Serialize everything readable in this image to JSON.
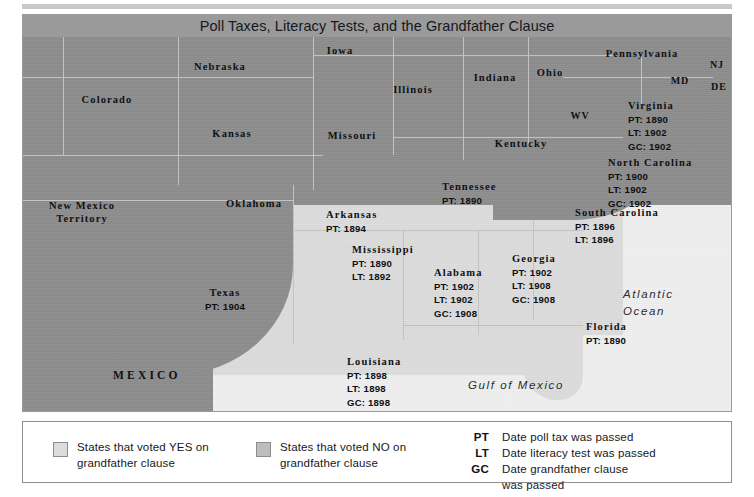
{
  "map": {
    "title": "Poll Taxes, Literacy Tests, and the Grandfather Clause",
    "colors": {
      "voted_no_fill": "#8d8d8d",
      "voted_yes_fill": "#dcdcdc",
      "ocean": "#efefef",
      "border": "#c3c3c3",
      "title_band": "#9a9a9a"
    },
    "water_labels": [
      {
        "name": "atlantic-ocean",
        "line1": "Atlantic",
        "line2": "Ocean"
      },
      {
        "name": "gulf-of-mexico",
        "line1": "Gulf of Mexico",
        "line2": ""
      }
    ],
    "country_label": "MEXICO",
    "plain_states": [
      {
        "name": "Nebraska",
        "label": "Nebraska"
      },
      {
        "name": "Iowa",
        "label": "Iowa"
      },
      {
        "name": "Colorado",
        "label": "Colorado"
      },
      {
        "name": "Kansas",
        "label": "Kansas"
      },
      {
        "name": "Missouri",
        "label": "Missouri"
      },
      {
        "name": "Illinois",
        "label": "Illinois"
      },
      {
        "name": "Indiana",
        "label": "Indiana"
      },
      {
        "name": "Ohio",
        "label": "Ohio"
      },
      {
        "name": "Pennsylvania",
        "label": "Pennsylvania"
      },
      {
        "name": "Kentucky",
        "label": "Kentucky"
      },
      {
        "name": "Oklahoma",
        "label": "Oklahoma"
      },
      {
        "name": "New Mexico Territory",
        "line1": "New Mexico",
        "line2": "Territory"
      },
      {
        "name": "West Virginia",
        "label": "WV"
      },
      {
        "name": "Maryland",
        "label": "MD"
      },
      {
        "name": "New Jersey",
        "label": "NJ"
      },
      {
        "name": "Delaware",
        "label": "DE"
      }
    ],
    "dated_states": [
      {
        "name": "Virginia",
        "label": "Virginia",
        "pt": "PT: 1890",
        "lt": "LT: 1902",
        "gc": "GC: 1902"
      },
      {
        "name": "North Carolina",
        "label": "North Carolina",
        "pt": "PT: 1900",
        "lt": "LT: 1902",
        "gc": "GC: 1902"
      },
      {
        "name": "South Carolina",
        "label": "South Carolina",
        "pt": "PT: 1896",
        "lt": "LT: 1896",
        "gc": ""
      },
      {
        "name": "Georgia",
        "label": "Georgia",
        "pt": "PT: 1902",
        "lt": "LT: 1908",
        "gc": "GC: 1908"
      },
      {
        "name": "Florida",
        "label": "Florida",
        "pt": "PT: 1890",
        "lt": "",
        "gc": ""
      },
      {
        "name": "Alabama",
        "label": "Alabama",
        "pt": "PT: 1902",
        "lt": "LT: 1902",
        "gc": "GC: 1908"
      },
      {
        "name": "Mississippi",
        "label": "Mississippi",
        "pt": "PT: 1890",
        "lt": "LT: 1892",
        "gc": ""
      },
      {
        "name": "Tennessee",
        "label": "Tennessee",
        "pt": "PT: 1890",
        "lt": "",
        "gc": ""
      },
      {
        "name": "Arkansas",
        "label": "Arkansas",
        "pt": "PT: 1894",
        "lt": "",
        "gc": ""
      },
      {
        "name": "Louisiana",
        "label": "Louisiana",
        "pt": "PT: 1898",
        "lt": "LT: 1898",
        "gc": "GC: 1898"
      },
      {
        "name": "Texas",
        "label": "Texas",
        "pt": "PT: 1904",
        "lt": "",
        "gc": ""
      }
    ]
  },
  "legend": {
    "yes": {
      "line1": "States that voted YES on",
      "line2": "grandfather clause"
    },
    "no": {
      "line1": "States that voted NO on",
      "line2": "grandfather clause"
    },
    "abbreviations": [
      {
        "key": "PT",
        "def_line1": "Date poll tax was passed",
        "def_line2": ""
      },
      {
        "key": "LT",
        "def_line1": "Date literacy test was passed",
        "def_line2": ""
      },
      {
        "key": "GC",
        "def_line1": "Date grandfather clause",
        "def_line2": "was passed"
      }
    ]
  }
}
